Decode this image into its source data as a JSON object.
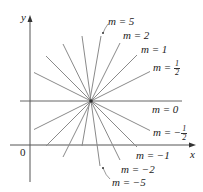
{
  "axes": {
    "x_label": "x",
    "y_label": "y",
    "origin_label": "0"
  },
  "center": {
    "x": 91,
    "y": 101
  },
  "lines": [
    {
      "m": "5",
      "slope": 5
    },
    {
      "m": "2",
      "slope": 2
    },
    {
      "m": "1",
      "slope": 1
    },
    {
      "m": "1/2",
      "slope": 0.5
    },
    {
      "m": "0",
      "slope": 0
    },
    {
      "m": "-1/2",
      "slope": -0.5
    },
    {
      "m": "-1",
      "slope": -1
    },
    {
      "m": "-2",
      "slope": -2
    },
    {
      "m": "-5",
      "slope": -5
    }
  ],
  "labels": {
    "m5": "m = 5",
    "m2": "m = 2",
    "m1": "m = 1",
    "mhalf_prefix": "m = ",
    "mhalf_num": "1",
    "mhalf_den": "2",
    "m0": "m = 0",
    "mneghalf_prefix": "m = −",
    "mneghalf_num": "1",
    "mneghalf_den": "2",
    "mneg1": "m = −1",
    "mneg2": "m = −2",
    "mneg5": "m = −5"
  },
  "colors": {
    "line": "#8a8a8a",
    "axis": "#555555",
    "text": "#222222"
  }
}
